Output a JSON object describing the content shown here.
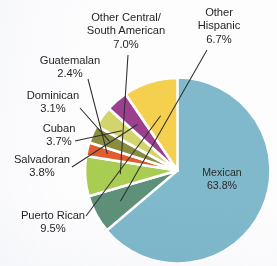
{
  "chart_data": {
    "type": "pie",
    "title": "",
    "subtitle": "",
    "xlabel": "",
    "ylabel": "",
    "grid": false,
    "legend_position": "callout-labels",
    "units": "percent",
    "total": 100.0,
    "start_angle_deg": -90,
    "direction": "clockwise",
    "categories": [
      "Mexican",
      "Other Hispanic",
      "Other Central/South American",
      "Guatemalan",
      "Dominican",
      "Cuban",
      "Salvadoran",
      "Puerto Rican"
    ],
    "values": [
      63.8,
      6.7,
      7.0,
      2.4,
      3.1,
      3.7,
      3.8,
      9.5
    ],
    "slices": [
      {
        "label": "Mexican",
        "value": 63.8,
        "value_text": "63.8%",
        "color": "#7fb9cb",
        "label_placement": "inside"
      },
      {
        "label": "Other Hispanic",
        "value": 6.7,
        "value_text": "6.7%",
        "color": "#5e9179",
        "label_placement": "callout"
      },
      {
        "label": "Other Central/South American",
        "value": 7.0,
        "value_text": "7.0%",
        "color": "#a9cc52",
        "label_placement": "callout"
      },
      {
        "label": "Guatemalan",
        "value": 2.4,
        "value_text": "2.4%",
        "color": "#e05d2f",
        "label_placement": "callout"
      },
      {
        "label": "Dominican",
        "value": 3.1,
        "value_text": "3.1%",
        "color": "#8a8c3f",
        "label_placement": "callout"
      },
      {
        "label": "Cuban",
        "value": 3.7,
        "value_text": "3.7%",
        "color": "#d3d46c",
        "label_placement": "callout"
      },
      {
        "label": "Salvadoran",
        "value": 3.8,
        "value_text": "3.8%",
        "color": "#9c3f8f",
        "label_placement": "callout"
      },
      {
        "label": "Puerto Rican",
        "value": 9.5,
        "value_text": "9.5%",
        "color": "#f5cf4e",
        "label_placement": "callout"
      }
    ]
  },
  "labels": {
    "mexican": {
      "name": "Mexican",
      "pct": "63.8%"
    },
    "other_hispanic": {
      "name_line1": "Other",
      "name_line2": "Hispanic",
      "pct": "6.7%"
    },
    "other_central": {
      "name_line1": "Other Central/",
      "name_line2": "South American",
      "pct": "7.0%"
    },
    "guatemalan": {
      "name": "Guatemalan",
      "pct": "2.4%"
    },
    "dominican": {
      "name": "Dominican",
      "pct": "3.1%"
    },
    "cuban": {
      "name": "Cuban",
      "pct": "3.7%"
    },
    "salvadoran": {
      "name": "Salvadoran",
      "pct": "3.8%"
    },
    "puerto_rican": {
      "name": "Puerto Rican",
      "pct": "9.5%"
    }
  },
  "colors": {
    "mexican": "#7fb9cb",
    "other_hispanic": "#5e9179",
    "other_central": "#a9cc52",
    "guatemalan": "#e05d2f",
    "dominican": "#8a8c3f",
    "cuban": "#d3d46c",
    "salvadoran": "#9c3f8f",
    "puerto_rican": "#f5cf4e",
    "background": "#fdfdfe",
    "text": "#231f20",
    "leader_line": "#2f2f2f",
    "slice_gap": "#ffffff"
  }
}
